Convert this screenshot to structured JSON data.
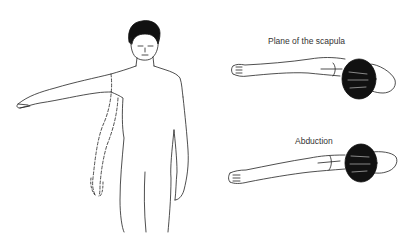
{
  "diagram": {
    "type": "anatomical-illustration",
    "panels": [
      {
        "id": "front-view",
        "description": "Standing man, front view, right arm raised laterally to horizontal; dashed outline shows arm resting at side"
      },
      {
        "id": "scapular-plane",
        "label": "Plane of the scapula",
        "description": "Top view of arm raised in the plane of the scapula, head shown as dark shaded oval"
      },
      {
        "id": "abduction",
        "label": "Abduction",
        "description": "Top view of arm raised in pure abduction (coronal plane)"
      }
    ]
  },
  "colors": {
    "line": "#222222",
    "hair": "#111111",
    "background": "#ffffff"
  }
}
